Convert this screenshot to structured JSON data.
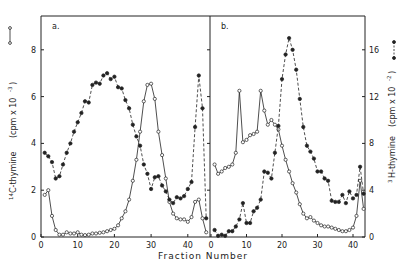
{
  "figure": {
    "xlabel": "Fraction Number",
    "ylabel_left": "14C-thymine (cpm x 10^-3)",
    "ylabel_left_sup": "14",
    "ylabel_left_main": "C-thymine",
    "ylabel_left_units": "(cpm x 10",
    "ylabel_left_exp": "-3",
    "ylabel_right": "3H-thymine (cpm x 10^-2)",
    "ylabel_right_sup": "3",
    "ylabel_right_main": "H-thymine",
    "ylabel_right_units": "(cpm x 10",
    "ylabel_right_exp": "-2",
    "panel_a_label": "a.",
    "panel_b_label": "b.",
    "left_ticks": [
      "0",
      "2",
      "4",
      "6",
      "8"
    ],
    "right_ticks": [
      "0",
      "4",
      "8",
      "12",
      "16"
    ],
    "x_ticks_a": [
      "0",
      "10",
      "20",
      "30",
      "40"
    ],
    "x_ticks_b": [
      "0",
      "10",
      "20",
      "30",
      "40"
    ],
    "colors": {
      "ink": "#222222",
      "background": "#ffffff"
    }
  },
  "chart_data": [
    {
      "type": "line",
      "panel": "a",
      "title": "a.",
      "xlabel": "Fraction Number",
      "ylabel": "14C-thymine (cpm x 10^-3)",
      "ylabel_right": "3H-thymine (cpm x 10^-2)",
      "xlim": [
        0,
        46
      ],
      "ylim": [
        0,
        9.2
      ],
      "grid": false,
      "legend": "open circles, solid line = 14C-thymine (left axis); filled circles, dashed line = 3H-thymine (right axis)",
      "series": [
        {
          "name": "14C-thymine",
          "marker": "open-circle",
          "line": "solid",
          "axis": "left",
          "x": [
            1,
            2,
            3,
            4,
            5,
            6,
            7,
            8,
            9,
            10,
            11,
            12,
            13,
            14,
            15,
            16,
            17,
            18,
            19,
            20,
            21,
            22,
            23,
            24,
            25,
            26,
            27,
            28,
            29,
            30,
            31,
            32,
            33,
            34,
            35,
            36,
            37,
            38,
            39,
            40,
            41,
            42,
            43,
            44,
            45
          ],
          "values": [
            1.8,
            2.0,
            0.9,
            0.3,
            0.1,
            0.1,
            0.2,
            0.15,
            0.15,
            0.2,
            0.1,
            0.08,
            0.1,
            0.15,
            0.15,
            0.18,
            0.2,
            0.25,
            0.3,
            0.35,
            0.5,
            0.8,
            1.1,
            1.6,
            2.4,
            3.3,
            4.5,
            5.8,
            6.5,
            6.55,
            5.9,
            4.5,
            3.5,
            2.5,
            1.5,
            1.0,
            0.8,
            0.75,
            0.75,
            0.65,
            0.85,
            1.5,
            1.6,
            0.8,
            0.2
          ]
        },
        {
          "name": "3H-thymine",
          "marker": "filled-circle",
          "line": "dashed",
          "axis": "right",
          "x": [
            1,
            2,
            3,
            4,
            5,
            6,
            7,
            8,
            9,
            10,
            11,
            12,
            13,
            14,
            15,
            16,
            17,
            18,
            19,
            20,
            21,
            22,
            23,
            24,
            25,
            26,
            27,
            28,
            29,
            30,
            31,
            32,
            33,
            34,
            35,
            36,
            37,
            38,
            39,
            40,
            41,
            42,
            43,
            44,
            45
          ],
          "values": [
            7.2,
            6.9,
            6.4,
            5.0,
            5.2,
            6.2,
            7.2,
            8.0,
            9.0,
            9.8,
            10.6,
            11.6,
            11.5,
            13.0,
            13.2,
            13.1,
            13.8,
            14.0,
            13.5,
            13.7,
            12.8,
            12.7,
            11.7,
            11.0,
            9.6,
            8.6,
            7.8,
            6.2,
            5.4,
            4.1,
            5.1,
            5.2,
            4.4,
            3.9,
            3.2,
            2.9,
            3.4,
            3.3,
            3.5,
            4.1,
            4.7,
            9.4,
            13.8,
            11.0,
            1.6
          ]
        }
      ]
    },
    {
      "type": "line",
      "panel": "b",
      "title": "b.",
      "xlabel": "Fraction Number",
      "ylabel": "14C-thymine (cpm x 10^-3)",
      "ylabel_right": "3H-thymine (cpm x 10^-2)",
      "xlim": [
        0,
        44
      ],
      "ylim_right": [
        0,
        18.4
      ],
      "grid": false,
      "series": [
        {
          "name": "14C-thymine",
          "marker": "open-circle",
          "line": "solid",
          "axis": "left",
          "x": [
            1,
            2,
            3,
            4,
            5,
            6,
            7,
            8,
            9,
            10,
            11,
            12,
            13,
            14,
            15,
            16,
            17,
            18,
            19,
            20,
            21,
            22,
            23,
            24,
            25,
            26,
            27,
            28,
            29,
            30,
            31,
            32,
            33,
            34,
            35,
            36,
            37,
            38,
            39,
            40,
            41,
            42,
            43
          ],
          "values": [
            3.1,
            2.7,
            2.8,
            2.95,
            3.0,
            3.1,
            3.6,
            6.25,
            4.05,
            4.15,
            4.35,
            4.4,
            4.5,
            6.25,
            5.4,
            4.8,
            5.0,
            4.8,
            4.6,
            3.9,
            3.3,
            2.8,
            2.3,
            1.9,
            1.4,
            1.0,
            0.8,
            0.85,
            0.7,
            0.6,
            0.5,
            0.45,
            0.45,
            0.4,
            0.35,
            0.3,
            0.25,
            0.25,
            0.3,
            0.4,
            0.9,
            2.4,
            1.2
          ]
        },
        {
          "name": "3H-thymine",
          "marker": "filled-circle",
          "line": "dashed",
          "axis": "right",
          "x": [
            1,
            2,
            3,
            4,
            5,
            6,
            7,
            8,
            9,
            10,
            11,
            12,
            13,
            14,
            15,
            16,
            17,
            18,
            19,
            20,
            21,
            22,
            23,
            24,
            25,
            26,
            27,
            28,
            29,
            30,
            31,
            32,
            33,
            34,
            35,
            36,
            37,
            38,
            39,
            40,
            41,
            42,
            43
          ],
          "values": [
            0.6,
            0.1,
            0.2,
            0.1,
            0.5,
            0.5,
            0.9,
            1.5,
            2.9,
            1.2,
            1.2,
            2.2,
            2.5,
            3.2,
            5.6,
            5.5,
            5.0,
            7.2,
            9.5,
            13.5,
            15.6,
            17.0,
            16.0,
            14.3,
            11.8,
            9.4,
            7.8,
            7.3,
            6.7,
            5.6,
            5.6,
            5.0,
            4.8,
            3.1,
            3.0,
            3.0,
            3.6,
            2.9,
            3.9,
            3.3,
            3.6,
            6.0,
            3.7
          ]
        }
      ]
    }
  ]
}
